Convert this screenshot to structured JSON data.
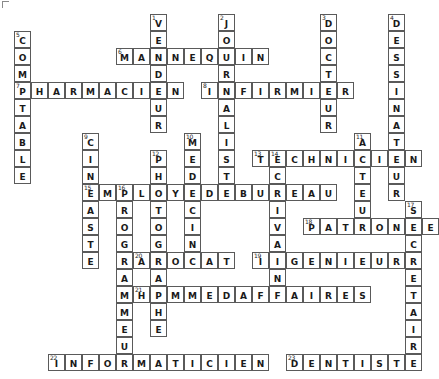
{
  "puzzle": {
    "title": "Crossword Grid - Les Metiers",
    "cell_size": 17,
    "origin_x": 14,
    "origin_y": 14,
    "colors": {
      "grid_line": "#5a5a5a",
      "cell_fill": "#ffffff",
      "text": "#1a1a1a",
      "page_background": "#ffffff"
    },
    "corner_mark": "corner-bracket",
    "entries_across": [
      {
        "number": 6,
        "answer": "MANNEQUIN",
        "row": 2,
        "col": 6
      },
      {
        "number": 7,
        "answer": "PHARMACIEN",
        "row": 4,
        "col": 0
      },
      {
        "number": 8,
        "answer": "INFIRMIER",
        "row": 4,
        "col": 11
      },
      {
        "number": 13,
        "answer": "TECHNICIEN",
        "row": 8,
        "col": 14
      },
      {
        "number": 15,
        "answer": "EMPLOYEDEBUREAU",
        "row": 10,
        "col": 4
      },
      {
        "number": 18,
        "answer": "PATRONNE",
        "row": 12,
        "col": 17
      },
      {
        "number": 19,
        "answer": "INGENIEUR",
        "row": 14,
        "col": 14
      },
      {
        "number": 20,
        "answer": "AVOCAT",
        "row": 14,
        "col": 7
      },
      {
        "number": 21,
        "answer": "HOMMEDAFFAIRES",
        "row": 16,
        "col": 7
      },
      {
        "number": 22,
        "answer": "INFORMATICIEN",
        "row": 20,
        "col": 2
      },
      {
        "number": 23,
        "answer": "DENTISTE",
        "row": 20,
        "col": 16
      }
    ],
    "entries_down": [
      {
        "number": 1,
        "answer": "VENDEUR",
        "row": 0,
        "col": 8
      },
      {
        "number": 2,
        "answer": "JOURNALISTE",
        "row": 0,
        "col": 12
      },
      {
        "number": 3,
        "answer": "DOCTEUR",
        "row": 0,
        "col": 18
      },
      {
        "number": 4,
        "answer": "DESSINATEUR",
        "row": 0,
        "col": 22
      },
      {
        "number": 5,
        "answer": "COMPTABLE",
        "row": 1,
        "col": 0
      },
      {
        "number": 9,
        "answer": "CINEASTE",
        "row": 7,
        "col": 4
      },
      {
        "number": 10,
        "answer": "MEDECIN",
        "row": 7,
        "col": 10
      },
      {
        "number": 11,
        "answer": "ACTEUR",
        "row": 7,
        "col": 20
      },
      {
        "number": 12,
        "answer": "PHOTOGRAPHE",
        "row": 8,
        "col": 8
      },
      {
        "number": 14,
        "answer": "ECRIVAIN",
        "row": 8,
        "col": 15
      },
      {
        "number": 16,
        "answer": "PROGRAMMEUR",
        "row": 10,
        "col": 6
      },
      {
        "number": 17,
        "answer": "SECRETAIRE",
        "row": 11,
        "col": 23
      }
    ]
  }
}
